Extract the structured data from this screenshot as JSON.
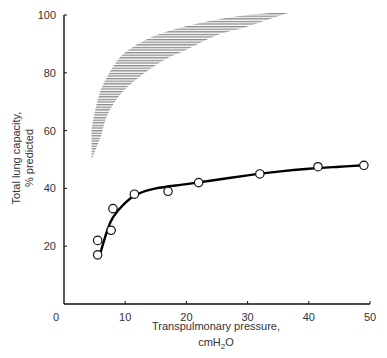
{
  "chart_data": {
    "type": "scatter",
    "title": "",
    "xlabel": "Transpulmonary pressure,",
    "xlabel_line2": "cmH2O",
    "ylabel": "Total lung capacity,",
    "ylabel_line2": "% predicted",
    "xlim": [
      0,
      50
    ],
    "ylim": [
      0,
      100
    ],
    "x_ticks": [
      0,
      10,
      20,
      30,
      40,
      50
    ],
    "y_ticks": [
      20,
      40,
      60,
      80,
      100
    ],
    "grid": false,
    "legend": null,
    "series": [
      {
        "name": "Observed data points",
        "type": "scatter",
        "marker": "open-circle",
        "x": [
          5.5,
          5.5,
          7.7,
          8.0,
          11.5,
          17.0,
          22.0,
          32.0,
          41.5,
          49.0
        ],
        "y": [
          17,
          22,
          25.5,
          33,
          38,
          39,
          42,
          45,
          47.5,
          48
        ]
      },
      {
        "name": "Fitted curve",
        "type": "line",
        "x": [
          6,
          7,
          8,
          10,
          12,
          15,
          20,
          25,
          30,
          35,
          40,
          45,
          49
        ],
        "y": [
          18,
          25,
          30,
          35,
          38,
          40,
          41.5,
          43,
          44.5,
          45.8,
          46.8,
          47.5,
          48
        ]
      },
      {
        "name": "Normal range (shaded band)",
        "type": "area",
        "upper": {
          "x": [
            4.5,
            5,
            6,
            8,
            10,
            14,
            18,
            24,
            30,
            37
          ],
          "y": [
            60,
            66,
            74,
            82,
            87,
            92,
            95,
            98,
            100,
            101
          ]
        },
        "lower": {
          "x": [
            4.5,
            6,
            7,
            9,
            12,
            16,
            20,
            25,
            30,
            37
          ],
          "y": [
            50,
            58,
            65,
            72,
            78,
            84,
            88,
            93,
            96,
            101
          ]
        }
      }
    ]
  },
  "labels": {
    "x_ticks": [
      "0",
      "10",
      "20",
      "30",
      "40",
      "50"
    ],
    "y_ticks": [
      "20",
      "40",
      "60",
      "80",
      "100"
    ],
    "xlabel": "Transpulmonary pressure,",
    "xlabel_unit_prefix": "cmH",
    "xlabel_unit_sub": "2",
    "xlabel_unit_suffix": "O",
    "ylabel": "Total lung capacity,",
    "ylabel2": "% predicted"
  },
  "colors": {
    "axis": "#111111",
    "curve": "#000000",
    "band": "#8a8a8a",
    "marker_fill": "#ffffff"
  }
}
